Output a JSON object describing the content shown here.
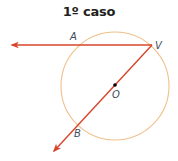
{
  "title": "1º caso",
  "colors": {
    "circle": "#f0c08a",
    "rays": "#d9452b",
    "labels": "#3c4a5c",
    "title": "#231f20",
    "center_point": "#000000"
  },
  "points": {
    "A": {
      "label": "A"
    },
    "V": {
      "label": "V"
    },
    "O": {
      "label": "O"
    },
    "B": {
      "label": "B"
    }
  }
}
